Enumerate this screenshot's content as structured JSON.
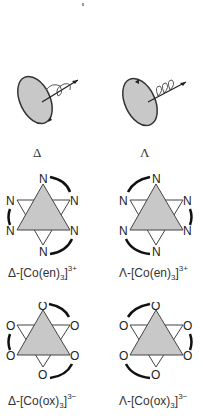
{
  "figure": {
    "row1": {
      "left": {
        "symbol": "Δ"
      },
      "right": {
        "symbol": "Λ"
      }
    },
    "row2": {
      "left": {
        "prefix": "Δ-[Co(en)",
        "subscript": "3",
        "close": "]",
        "charge": "3+",
        "donor_atom": "N"
      },
      "right": {
        "prefix": "Λ-[Co(en)",
        "subscript": "3",
        "close": "]",
        "charge": "3+",
        "donor_atom": "N"
      }
    },
    "row3": {
      "left": {
        "prefix": "Δ-[Co(ox)",
        "subscript": "3",
        "close": "]",
        "charge": "3−",
        "donor_atom": "O"
      },
      "right": {
        "prefix": "Λ-[Co(ox)",
        "subscript": "3",
        "close": "]",
        "charge": "3−",
        "donor_atom": "O"
      }
    },
    "colors": {
      "fill": "#c8c8c8",
      "line": "#333333",
      "arc": "#1a1a1a"
    }
  }
}
